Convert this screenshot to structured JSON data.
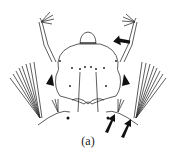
{
  "figure": {
    "caption": "(a)",
    "arrows": [
      {
        "id": "arrow-antenna",
        "direction": "pointing left toward right antennal setae"
      },
      {
        "id": "arrow-lower-1",
        "direction": "pointing up-right"
      },
      {
        "id": "arrow-lower-2",
        "direction": "pointing up-right"
      }
    ],
    "colors": {
      "line": "#333333",
      "fill": "#111111",
      "background": "#ffffff"
    }
  }
}
